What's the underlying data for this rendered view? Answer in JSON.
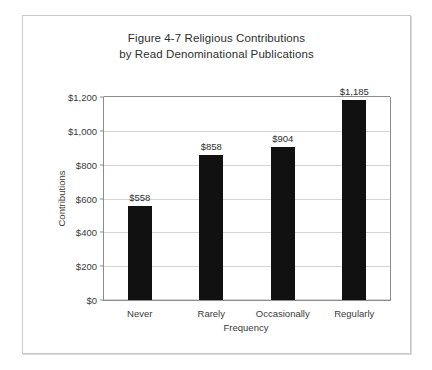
{
  "chart_data": {
    "type": "bar",
    "title": "Figure 4-7 Religious Contributions by Read Denominational Publications",
    "title_lines": [
      "Figure 4-7 Religious Contributions",
      "by Read Denominational Publications"
    ],
    "categories": [
      "Never",
      "Rarely",
      "Occasionally",
      "Regularly"
    ],
    "values": [
      558,
      858,
      904,
      1185
    ],
    "value_labels": [
      "$558",
      "$858",
      "$904",
      "$1,185"
    ],
    "xlabel": "Frequency",
    "ylabel": "Contributions",
    "ylim": [
      0,
      1200
    ],
    "ytick_values": [
      0,
      200,
      400,
      600,
      800,
      1000,
      1200
    ],
    "ytick_labels": [
      "$0",
      "$200",
      "$400",
      "$600",
      "$800",
      "$1,000",
      "$1,200"
    ],
    "grid": true,
    "legend": false,
    "bar_color": "#111111",
    "gridline_color": "#d5d5d5",
    "axis_color": "#8c8c8c",
    "background": "#ffffff"
  }
}
